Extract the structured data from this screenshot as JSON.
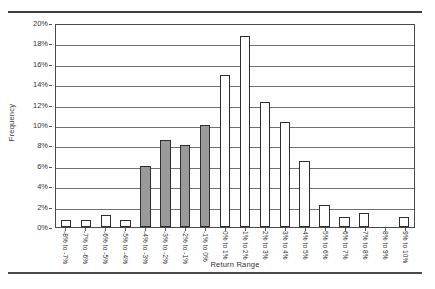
{
  "header": {
    "ghost_left": "",
    "ghost_right": ""
  },
  "chart_data": {
    "type": "bar",
    "title": "",
    "xlabel": "Return Range",
    "ylabel": "Frequency",
    "ylim": [
      0,
      20
    ],
    "ytick_labels": [
      "20%",
      "18%",
      "16%",
      "14%",
      "12%",
      "10%",
      "8%",
      "6%",
      "4%",
      "2%",
      "0%"
    ],
    "ytick_values": [
      20,
      18,
      16,
      14,
      12,
      10,
      8,
      6,
      4,
      2,
      0
    ],
    "grid": true,
    "legend": "none",
    "categories": [
      "-8% to -7%",
      "-7% to -6%",
      "-6% to -5%",
      "-5% to -4%",
      "-4% to -3%",
      "-3% to -2%",
      "-2% to -1%",
      "-1% to 0%",
      "0% to 1%",
      "1% to 2%",
      "2% to 3%",
      "3% to 4%",
      "4% to 5%",
      "5% to 6%",
      "6% to 7%",
      "7% to 8%",
      "8% to 9%",
      "9% to 10%"
    ],
    "values": [
      0.7,
      0.7,
      1.2,
      0.7,
      6.0,
      8.5,
      8.0,
      10.0,
      14.9,
      18.7,
      12.3,
      10.3,
      6.5,
      2.2,
      1.0,
      1.4,
      0.0,
      1.0
    ],
    "filled_indices": [
      4,
      5,
      6,
      7
    ],
    "colors": {
      "bar_fill_highlight": "#9a9a9a",
      "bar_fill_default": "#ffffff",
      "bar_border": "#2e2e2e",
      "gridline": "#707070",
      "axis": "#4a4a4a"
    }
  }
}
